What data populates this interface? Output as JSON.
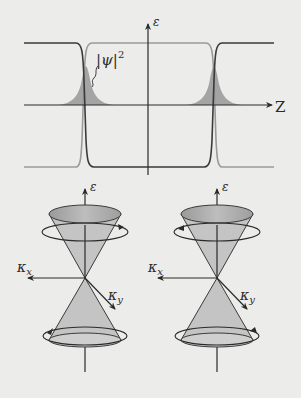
{
  "figure": {
    "top_panel": {
      "y_axis_label": "ε",
      "x_axis_label": "Z",
      "density_label": "|ψ|",
      "density_exponent": "2",
      "curves": [
        {
          "name": "dark band (outer high, inner low)",
          "color": "#3a3a3a"
        },
        {
          "name": "light band (outer low, inner high)",
          "color": "#9a9a9a"
        }
      ],
      "shaded_color": "#9c9c9c"
    },
    "bottom_panel": {
      "cones": [
        {
          "name": "left-dirac-cone",
          "energy_label": "ε",
          "kx_label": "κ",
          "kx_sub": "x",
          "ky_label": "κ",
          "ky_sub": "y",
          "helicity": "counterclockwise-top"
        },
        {
          "name": "right-dirac-cone",
          "energy_label": "ε",
          "kx_label": "κ",
          "kx_sub": "x",
          "ky_label": "κ",
          "ky_sub": "y",
          "helicity": "clockwise-top"
        }
      ],
      "cone_fill": "#c4c4c4",
      "cone_top_fill": "#a6a6a6"
    },
    "colors": {
      "background": "#ececea",
      "axis": "#2a2a2a"
    }
  }
}
